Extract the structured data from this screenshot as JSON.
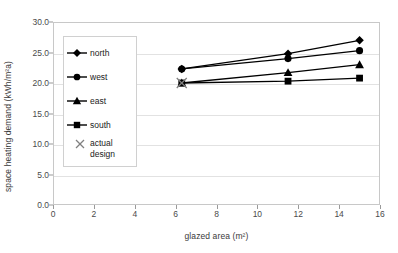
{
  "chart_data": {
    "type": "line",
    "title": "",
    "xlabel": "glazed area (m²)",
    "ylabel": "space heating demand (kWh/m²a)",
    "xlim": [
      0,
      16
    ],
    "ylim": [
      0,
      30
    ],
    "xticks": [
      "0",
      "2",
      "4",
      "6",
      "8",
      "10",
      "12",
      "14",
      "16"
    ],
    "xtick_values": [
      0,
      2,
      4,
      6,
      8,
      10,
      12,
      14,
      16
    ],
    "yticks": [
      "0.0",
      "5.0",
      "10.0",
      "15.0",
      "20.0",
      "25.0",
      "30.0"
    ],
    "ytick_values": [
      0,
      5,
      10,
      15,
      20,
      25,
      30
    ],
    "grid": "horizontal",
    "legend_position": "upper-left-inside",
    "x": [
      6.3,
      11.5,
      15.0
    ],
    "series": [
      {
        "name": "north",
        "marker": "diamond",
        "values": [
          22.3,
          24.8,
          27.0
        ]
      },
      {
        "name": "west",
        "marker": "circle",
        "values": [
          22.3,
          24.0,
          25.3
        ]
      },
      {
        "name": "east",
        "marker": "triangle",
        "values": [
          20.0,
          21.7,
          23.0
        ]
      },
      {
        "name": "south",
        "marker": "square",
        "values": [
          20.0,
          20.3,
          20.8
        ]
      }
    ],
    "annotations": [
      {
        "name": "actual design",
        "marker": "x",
        "x": 6.3,
        "y": 20.0,
        "color": "#808080"
      }
    ],
    "legend_entries": [
      {
        "label": "north",
        "marker": "diamond"
      },
      {
        "label": "west",
        "marker": "circle"
      },
      {
        "label": "east",
        "marker": "triangle"
      },
      {
        "label": "south",
        "marker": "square"
      },
      {
        "label": "actual\ndesign",
        "marker": "x"
      }
    ],
    "colors": {
      "series_line": "#000000",
      "marker_fill": "#000000",
      "gridline": "#e2e2e2",
      "frame": "#c8c8c8",
      "annotation": "#808080",
      "text": "#3a3a3a"
    }
  }
}
